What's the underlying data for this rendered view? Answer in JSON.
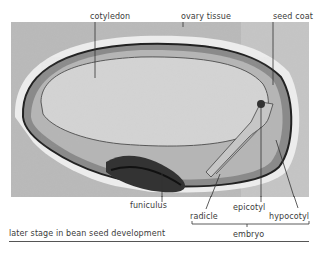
{
  "figure": {
    "caption": "later stage in bean seed development",
    "labels": {
      "cotyledon": "cotyledon",
      "ovary_tissue": "ovary tissue",
      "seed_coat": "seed coat",
      "funiculus": "funiculus",
      "radicle": "radicle",
      "epicotyl": "epicotyl",
      "hypocotyl": "hypocotyl",
      "embryo": "embryo"
    }
  }
}
